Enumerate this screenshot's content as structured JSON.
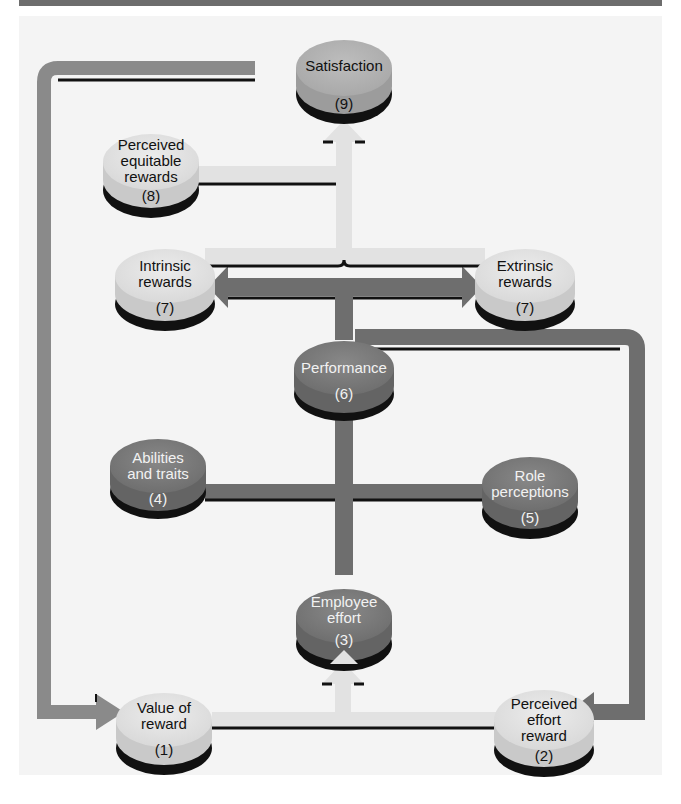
{
  "header": {
    "bar_color": "#6d6d6d",
    "visible_text": ""
  },
  "diagram": {
    "title": "",
    "colors": {
      "panel_background": "#f4f4f4",
      "light_node_top": "#e6e6e6",
      "light_node_side": "#c8c8c8",
      "dark_node_top": "#7b7b7b",
      "dark_node_side": "#666666",
      "mid_node_top": "#b4b4b4",
      "shadow": "#111111",
      "feedback_arrow": "#8a8a8a",
      "light_arrow": "#e2e2e2",
      "dark_arrow": "#6e6e6e"
    },
    "nodes": [
      {
        "id": "value-of-reward",
        "label_lines": [
          "Value of",
          "reward"
        ],
        "number": "(1)"
      },
      {
        "id": "perceived-effort-reward",
        "label_lines": [
          "Perceived",
          "effort",
          "reward"
        ],
        "number": "(2)"
      },
      {
        "id": "employee-effort",
        "label_lines": [
          "Employee",
          "effort"
        ],
        "number": "(3)"
      },
      {
        "id": "abilities-and-traits",
        "label_lines": [
          "Abilities",
          "and traits"
        ],
        "number": "(4)"
      },
      {
        "id": "role-perceptions",
        "label_lines": [
          "Role",
          "perceptions"
        ],
        "number": "(5)"
      },
      {
        "id": "performance",
        "label_lines": [
          "Performance"
        ],
        "number": "(6)"
      },
      {
        "id": "intrinsic-rewards",
        "label_lines": [
          "Intrinsic",
          "rewards"
        ],
        "number": "(7)"
      },
      {
        "id": "extrinsic-rewards",
        "label_lines": [
          "Extrinsic",
          "rewards"
        ],
        "number": "(7)"
      },
      {
        "id": "perceived-equitable-rewards",
        "label_lines": [
          "Perceived",
          "equitable",
          "rewards"
        ],
        "number": "(8)"
      },
      {
        "id": "satisfaction",
        "label_lines": [
          "Satisfaction"
        ],
        "number": "(9)"
      }
    ],
    "edges": [
      {
        "from": "value-of-reward",
        "to": "employee-effort"
      },
      {
        "from": "perceived-effort-reward",
        "to": "employee-effort"
      },
      {
        "from": "employee-effort",
        "to": "performance"
      },
      {
        "from": "abilities-and-traits",
        "to": "performance"
      },
      {
        "from": "role-perceptions",
        "to": "performance"
      },
      {
        "from": "performance",
        "to": "intrinsic-rewards"
      },
      {
        "from": "performance",
        "to": "extrinsic-rewards"
      },
      {
        "from": "performance",
        "to": "perceived-effort-reward",
        "type": "feedback"
      },
      {
        "from": "intrinsic-rewards",
        "to": "satisfaction"
      },
      {
        "from": "extrinsic-rewards",
        "to": "satisfaction"
      },
      {
        "from": "perceived-equitable-rewards",
        "to": "satisfaction"
      },
      {
        "from": "satisfaction",
        "to": "value-of-reward",
        "type": "feedback"
      }
    ]
  },
  "caption": {
    "visible_text": ""
  }
}
